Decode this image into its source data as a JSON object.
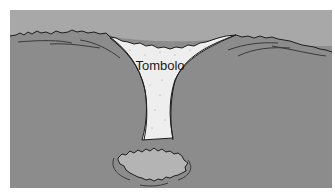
{
  "diagram": {
    "type": "landform-illustration",
    "label": "Tombolo",
    "colors": {
      "sky": "#a6a6a6",
      "water": "#8e8e8e",
      "land": "#8a8a8a",
      "sand": "#eeeeee",
      "island": "#b4b4b4",
      "outline": "#1e1e1e",
      "background": "#ffffff"
    }
  }
}
